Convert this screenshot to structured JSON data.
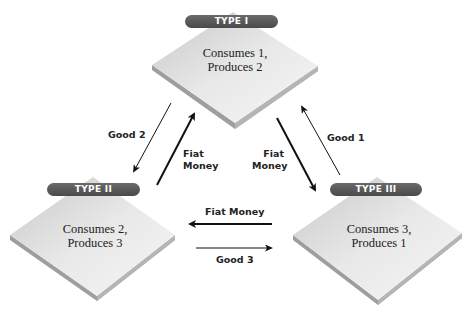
{
  "nodes": [
    {
      "id": "type1",
      "label": "TYPE I",
      "line1": "Consumes 1,",
      "line2": "Produces 2"
    },
    {
      "id": "type2",
      "label": "TYPE II",
      "line1": "Consumes 2,",
      "line2": "Produces 3"
    },
    {
      "id": "type3",
      "label": "TYPE III",
      "line1": "Consumes 3,",
      "line2": "Produces 1"
    }
  ],
  "flows": {
    "good2": {
      "label": "Good 2",
      "from": "TYPE I",
      "to": "TYPE II"
    },
    "fiat_2_to_1": {
      "line1": "Fiat",
      "line2": "Money",
      "from": "TYPE II",
      "to": "TYPE I"
    },
    "fiat_1_to_3": {
      "line1": "Fiat",
      "line2": "Money",
      "from": "TYPE I",
      "to": "TYPE III"
    },
    "good1": {
      "label": "Good 1",
      "from": "TYPE III",
      "to": "TYPE I"
    },
    "fiat_3_to_2": {
      "label": "Fiat Money",
      "from": "TYPE III",
      "to": "TYPE II"
    },
    "good3": {
      "label": "Good 3",
      "from": "TYPE II",
      "to": "TYPE III"
    }
  },
  "colors": {
    "pill": "#555555",
    "tile_top": "#e6e6e6",
    "tile_edge": "#9a9a9a",
    "arrow": "#111111"
  }
}
